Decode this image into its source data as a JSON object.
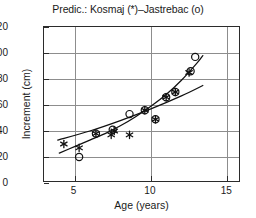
{
  "chart_data": {
    "type": "scatter",
    "title": "Predic.: Kosmaj (*)–Jastrebac (o)",
    "xlabel": "Age (years)",
    "ylabel": "Increment (cm)",
    "xlim": [
      3,
      15.9
    ],
    "ylim": [
      0,
      120
    ],
    "xticks": [
      5,
      10,
      15
    ],
    "yticks": [
      0,
      20,
      40,
      60,
      80,
      100,
      120
    ],
    "grid": true,
    "legend_position": "in-title",
    "series": [
      {
        "name": "Kosmaj",
        "marker": "*",
        "marker_symbol": "asterisk",
        "points": [
          {
            "x": 4.3,
            "y": 30
          },
          {
            "x": 5.3,
            "y": 27
          },
          {
            "x": 6.4,
            "y": 38
          },
          {
            "x": 7.4,
            "y": 37
          },
          {
            "x": 7.6,
            "y": 40
          },
          {
            "x": 8.6,
            "y": 37
          },
          {
            "x": 9.6,
            "y": 56
          },
          {
            "x": 10.3,
            "y": 49
          },
          {
            "x": 11.0,
            "y": 66
          },
          {
            "x": 11.6,
            "y": 70
          },
          {
            "x": 12.5,
            "y": 85
          }
        ]
      },
      {
        "name": "Jastrebac",
        "marker": "o",
        "marker_symbol": "open-circle",
        "points": [
          {
            "x": 5.3,
            "y": 20
          },
          {
            "x": 6.4,
            "y": 38
          },
          {
            "x": 7.5,
            "y": 41
          },
          {
            "x": 8.6,
            "y": 53
          },
          {
            "x": 9.6,
            "y": 56
          },
          {
            "x": 10.3,
            "y": 49
          },
          {
            "x": 11.0,
            "y": 66
          },
          {
            "x": 11.6,
            "y": 70
          },
          {
            "x": 12.6,
            "y": 86
          },
          {
            "x": 12.9,
            "y": 97
          }
        ]
      }
    ],
    "fit_curves": [
      {
        "name": "Kosmaj fit",
        "style": "solid-curved",
        "points": [
          {
            "x": 4.0,
            "y": 23
          },
          {
            "x": 5.0,
            "y": 28
          },
          {
            "x": 6.0,
            "y": 33
          },
          {
            "x": 7.0,
            "y": 38
          },
          {
            "x": 8.0,
            "y": 44
          },
          {
            "x": 9.0,
            "y": 51
          },
          {
            "x": 10.0,
            "y": 59
          },
          {
            "x": 11.0,
            "y": 68
          },
          {
            "x": 12.0,
            "y": 79
          },
          {
            "x": 13.0,
            "y": 92
          },
          {
            "x": 13.4,
            "y": 98
          }
        ]
      },
      {
        "name": "Jastrebac fit",
        "style": "solid-straight",
        "points": [
          {
            "x": 3.9,
            "y": 33
          },
          {
            "x": 6.0,
            "y": 40
          },
          {
            "x": 8.0,
            "y": 48
          },
          {
            "x": 10.0,
            "y": 57
          },
          {
            "x": 12.0,
            "y": 67
          },
          {
            "x": 13.4,
            "y": 75
          }
        ]
      }
    ]
  },
  "axis": {
    "ytick_labels": [
      "120",
      "100",
      "80",
      "60",
      "40",
      "20",
      "0"
    ],
    "xtick_labels": [
      "5",
      "10",
      "15"
    ]
  },
  "colors": {
    "frame": "#2b2b2b",
    "grid": "#8d8d8d",
    "marker": "#111111",
    "curve": "#111111",
    "background": "#ffffff"
  }
}
